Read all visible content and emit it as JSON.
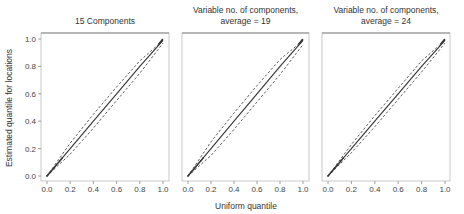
{
  "chart_data": [
    {
      "type": "line",
      "title": "15 Components",
      "xlabel": "Uniform quantile",
      "ylabel": "Estimated quantile for locations",
      "xlim": [
        0,
        1
      ],
      "ylim": [
        0,
        1
      ],
      "x_ticks": [
        "0.0",
        "0.2",
        "0.4",
        "0.6",
        "0.8",
        "1.0"
      ],
      "y_ticks": [
        "0.0",
        "0.2",
        "0.4",
        "0.6",
        "0.8",
        "1.0"
      ],
      "grid": false,
      "series": [
        {
          "name": "median",
          "style": "solid",
          "x": [
            0,
            0.2,
            0.4,
            0.6,
            0.8,
            1.0
          ],
          "y": [
            0,
            0.2,
            0.4,
            0.6,
            0.8,
            0.99
          ]
        },
        {
          "name": "upper band",
          "style": "dashed",
          "x": [
            0,
            0.2,
            0.4,
            0.6,
            0.8,
            1.0
          ],
          "y": [
            0,
            0.24,
            0.45,
            0.65,
            0.84,
            0.99
          ]
        },
        {
          "name": "lower band",
          "style": "dashed",
          "x": [
            0,
            0.2,
            0.4,
            0.6,
            0.8,
            1.0
          ],
          "y": [
            0,
            0.16,
            0.35,
            0.55,
            0.75,
            0.97
          ]
        }
      ]
    },
    {
      "type": "line",
      "title": "Variable no. of components,\naverage = 19",
      "xlabel": "Uniform quantile",
      "ylabel": "",
      "xlim": [
        0,
        1
      ],
      "ylim": [
        0,
        1
      ],
      "x_ticks": [
        "0.0",
        "0.2",
        "0.4",
        "0.6",
        "0.8",
        "1.0"
      ],
      "grid": false,
      "series": [
        {
          "name": "median",
          "style": "solid",
          "x": [
            0,
            0.2,
            0.4,
            0.6,
            0.8,
            1.0
          ],
          "y": [
            0,
            0.2,
            0.4,
            0.6,
            0.8,
            0.99
          ]
        },
        {
          "name": "upper band",
          "style": "dashed",
          "x": [
            0,
            0.2,
            0.4,
            0.6,
            0.8,
            1.0
          ],
          "y": [
            0,
            0.25,
            0.46,
            0.66,
            0.85,
            0.99
          ]
        },
        {
          "name": "lower band",
          "style": "dashed",
          "x": [
            0,
            0.2,
            0.4,
            0.6,
            0.8,
            1.0
          ],
          "y": [
            0,
            0.15,
            0.34,
            0.54,
            0.74,
            0.96
          ]
        }
      ]
    },
    {
      "type": "line",
      "title": "Variable no. of components,\naverage = 24",
      "xlabel": "Uniform quantile",
      "ylabel": "",
      "xlim": [
        0,
        1
      ],
      "ylim": [
        0,
        1
      ],
      "x_ticks": [
        "0.0",
        "0.2",
        "0.4",
        "0.6",
        "0.8",
        "1.0"
      ],
      "grid": false,
      "series": [
        {
          "name": "median",
          "style": "solid",
          "x": [
            0,
            0.2,
            0.4,
            0.6,
            0.8,
            1.0
          ],
          "y": [
            0,
            0.2,
            0.4,
            0.6,
            0.8,
            0.99
          ]
        },
        {
          "name": "upper band",
          "style": "dashed",
          "x": [
            0,
            0.2,
            0.4,
            0.6,
            0.8,
            1.0
          ],
          "y": [
            0,
            0.23,
            0.44,
            0.64,
            0.84,
            0.99
          ]
        },
        {
          "name": "lower band",
          "style": "dashed",
          "x": [
            0,
            0.2,
            0.4,
            0.6,
            0.8,
            1.0
          ],
          "y": [
            0,
            0.17,
            0.36,
            0.56,
            0.76,
            0.97
          ]
        }
      ]
    }
  ],
  "panels": [
    {
      "title_line1": "15 Components",
      "title_line2": ""
    },
    {
      "title_line1": "Variable no. of components,",
      "title_line2": "average = 19"
    },
    {
      "title_line1": "Variable no. of components,",
      "title_line2": "average = 24"
    }
  ],
  "axes": {
    "xlabel": "Uniform quantile",
    "ylabel": "Estimated quantile for locations",
    "tick_labels": [
      "0.0",
      "0.2",
      "0.4",
      "0.6",
      "0.8",
      "1.0"
    ]
  },
  "colors": {
    "line": "#333333",
    "frame": "#888888",
    "text": "#333333"
  }
}
